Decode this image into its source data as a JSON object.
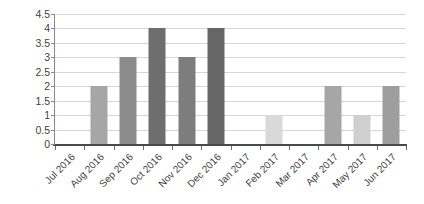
{
  "chart_data": {
    "type": "bar",
    "title": "",
    "subtitle": "",
    "xlabel": "",
    "ylabel": "",
    "categories": [
      "Jul 2016",
      "Aug 2016",
      "Sep 2016",
      "Oct 2016",
      "Nov 2016",
      "Dec 2016",
      "Jan 2017",
      "Feb 2017",
      "Mar 2017",
      "Apr 2017",
      "May 2017",
      "Jun 2017"
    ],
    "values": [
      0,
      2,
      3,
      4,
      3,
      4,
      0,
      1,
      0,
      2,
      1,
      2
    ],
    "bar_colors": [
      "#ffffff",
      "#a6a6a6",
      "#8c8c8c",
      "#6e6e6e",
      "#7d7d7d",
      "#666666",
      "#ffffff",
      "#d9d9d9",
      "#ffffff",
      "#a6a6a6",
      "#cfcfcf",
      "#9e9e9e"
    ],
    "ylim": [
      0,
      4.5
    ],
    "ytick_values": [
      0,
      0.5,
      1,
      1.5,
      2,
      2.5,
      3,
      3.5,
      4,
      4.5
    ],
    "ytick_labels": [
      "0",
      "0.5",
      "1",
      "1.5",
      "2",
      "2.5",
      "3",
      "3.5",
      "4",
      "4.5"
    ],
    "grid": true,
    "grid_color": "#d7d7d7",
    "axis_color": "#4a4a4a",
    "legend": null,
    "legend_position": "none",
    "background": "#ffffff",
    "annotations": []
  }
}
